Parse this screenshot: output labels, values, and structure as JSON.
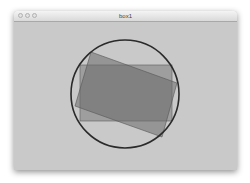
{
  "window": {
    "title": "box1",
    "background": "#c9c9c9"
  },
  "canvas": {
    "circle": {
      "cx": 125,
      "cy": 94,
      "r": 54,
      "stroke": "#2a2a2a"
    },
    "axis_rect": {
      "x": 80,
      "y": 65,
      "width": 92,
      "height": 56,
      "fill": "#7a7a7a"
    },
    "rotated_rect": {
      "points": "91,52 177,83 162,137 75,106",
      "fill": "#6a6a6a"
    }
  }
}
